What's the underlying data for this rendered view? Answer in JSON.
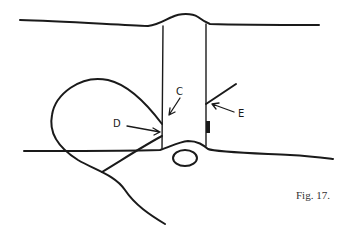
{
  "figure": {
    "caption": "Fig. 17.",
    "labels": {
      "c": "C",
      "d": "D",
      "e": "E"
    },
    "colors": {
      "ink": "#1a1a1a",
      "caption": "#333333",
      "background": "#ffffff"
    }
  }
}
